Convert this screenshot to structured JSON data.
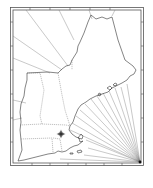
{
  "map": {
    "title": "",
    "region": "New England",
    "style": "portolan outline map with rhumb lines",
    "colors": {
      "background": "#ffffff",
      "frame": "#555555",
      "coastline": "#333333",
      "rhumb_lines": "#777777",
      "state_borders": "#666666"
    },
    "states": [
      "Maine",
      "New Hampshire",
      "Vermont",
      "Massachusetts",
      "Rhode Island",
      "Connecticut"
    ],
    "features": {
      "compass_rose": "compass-rose-icon",
      "rhumb_origin": "bottom-right corner",
      "rhumb_line_count_bottom_right": 16,
      "rhumb_line_count_top_left": 6
    },
    "labels": []
  }
}
